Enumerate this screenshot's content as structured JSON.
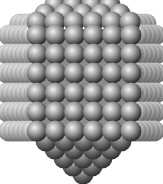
{
  "figure": {
    "title": "Nanocrystal atom cluster",
    "width": 163,
    "height": 184,
    "background": "#ffffff",
    "sphere_radius": 10.5,
    "colors": {
      "highlight": "#f2f2f2",
      "mid": "#9a9a9a",
      "shadow": "#3c3c3c",
      "edge": "#1e1e1e",
      "side_highlight": "#fafafa",
      "side_mid": "#b4b4b4",
      "side_shadow": "#606060",
      "bottom_highlight": "#bdbdbd",
      "bottom_mid": "#6e6e6e",
      "bottom_shadow": "#262626"
    },
    "front_face": {
      "columns_x": [
        37,
        55.5,
        74.5,
        93.5,
        112.5,
        131
      ],
      "rows_y": [
        35,
        54,
        73,
        93,
        112,
        131
      ]
    },
    "top_pyramid": [
      {
        "y": 5,
        "x": [
          55,
          73,
          92,
          110
        ]
      },
      {
        "y": 14,
        "x": [
          45,
          64,
          83,
          101,
          120
        ]
      },
      {
        "y": 22,
        "x": [
          37,
          55,
          74,
          93,
          112,
          130
        ]
      }
    ],
    "left_rods": {
      "rows_y": [
        24,
        35,
        54,
        73,
        93,
        112,
        131
      ],
      "start_x": [
        20,
        9,
        7,
        7,
        7,
        8,
        9
      ],
      "end_x": [
        44,
        35,
        35,
        35,
        35,
        35,
        35
      ],
      "step": 4.5
    },
    "right_rods": {
      "rows_y": [
        24,
        35,
        54,
        73,
        93,
        112,
        131
      ],
      "start_x": [
        126,
        133,
        133,
        133,
        133,
        133,
        133
      ],
      "end_x": [
        146,
        155,
        156,
        156,
        156,
        155,
        154
      ],
      "step": 4.5
    },
    "bottom_pyramid": [
      {
        "y": 141,
        "x": [
          46,
          65,
          84,
          102,
          121
        ]
      },
      {
        "y": 149,
        "x": [
          55,
          74,
          93,
          111
        ]
      },
      {
        "y": 158,
        "x": [
          64,
          83,
          102
        ]
      },
      {
        "y": 166,
        "x": [
          73,
          92
        ]
      },
      {
        "y": 174,
        "x": [
          83
        ]
      }
    ]
  }
}
